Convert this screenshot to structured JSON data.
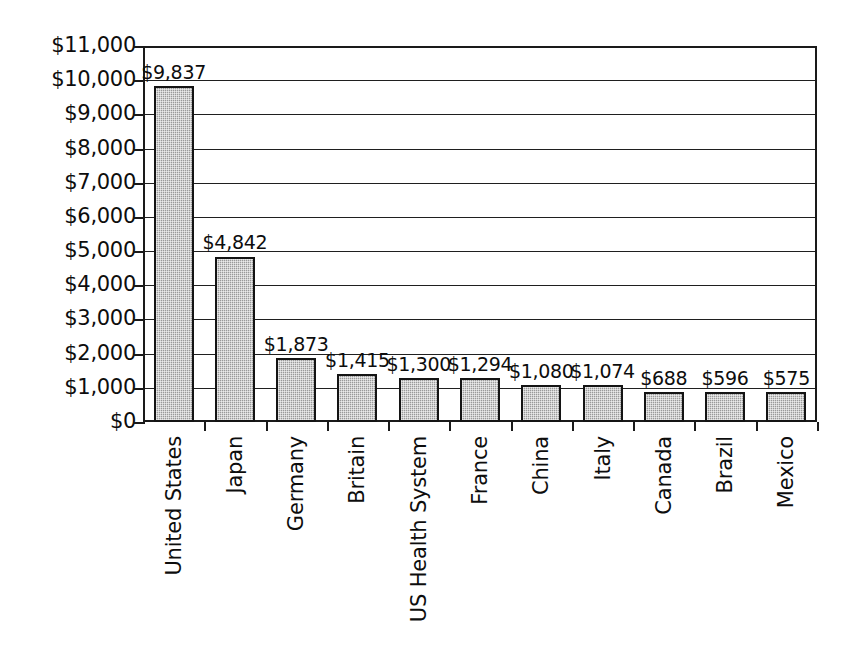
{
  "chart_data": {
    "type": "bar",
    "title": "",
    "subtitle": "",
    "xlabel": "",
    "ylabel": "In Billions",
    "ylim": [
      0,
      11000
    ],
    "ytick_step": 1000,
    "grid": true,
    "legend": "none",
    "orientation": "vertical",
    "value_labels_shown": true,
    "categories": [
      "United States",
      "Japan",
      "Germany",
      "Britain",
      "US Health System",
      "France",
      "China",
      "Italy",
      "Canada",
      "Brazil",
      "Mexico"
    ],
    "values": [
      9837,
      4842,
      1873,
      1415,
      1300,
      1294,
      1080,
      1074,
      688,
      596,
      575
    ],
    "value_labels": [
      "$9,837",
      "$4,842",
      "$1,873",
      "$1,415",
      "$1,300",
      "$1,294",
      "$1,080",
      "$1,074",
      "$688",
      "$596",
      "$575"
    ],
    "ytick_labels": [
      "$11,000",
      "$10,000",
      "$9,000",
      "$8,000",
      "$7,000",
      "$6,000",
      "$5,000",
      "$4,000",
      "$3,000",
      "$2,000",
      "$1,000",
      "$0"
    ],
    "ytick_values": [
      11000,
      10000,
      9000,
      8000,
      7000,
      6000,
      5000,
      4000,
      3000,
      2000,
      1000,
      0
    ],
    "colors": {
      "bar_fill": "#9a9a9a",
      "bar_outline": "#141414",
      "axis": "#1a1a1a",
      "gridline": "#1f1f1f",
      "text": "#0d0d0d",
      "background": "#ffffff"
    }
  }
}
